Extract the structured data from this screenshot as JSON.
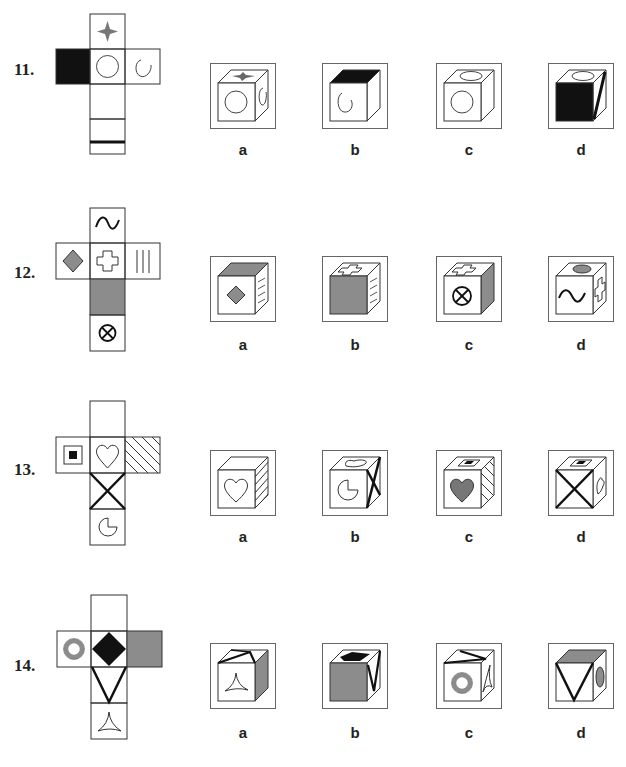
{
  "colors": {
    "gray": "#8c8c8c",
    "black": "#111111",
    "line": "#333333"
  },
  "questions": [
    {
      "number": "11.",
      "net": {
        "top": "four-point-star",
        "left": "solid-black",
        "center": "circle",
        "right": "spiral",
        "below1": "blank",
        "below2": "thick-horizontal-line"
      },
      "options": [
        {
          "label": "a",
          "top": "four-point-star",
          "front": "circle",
          "side": "spiral"
        },
        {
          "label": "b",
          "top": "solid-black",
          "front": "spiral",
          "side": "blank"
        },
        {
          "label": "c",
          "top": "ellipse",
          "front": "circle",
          "side": "blank"
        },
        {
          "label": "d",
          "top": "ellipse",
          "front": "solid-black",
          "side": "thick-diagonal-line"
        }
      ]
    },
    {
      "number": "12.",
      "net": {
        "top": "wave",
        "left": "gray-diamond",
        "center": "cross-outline",
        "right": "vertical-lines",
        "below1": "solid-gray",
        "below2": "circled-x"
      },
      "options": [
        {
          "label": "a",
          "top": "solid-gray",
          "front": "gray-diamond",
          "side": "lines"
        },
        {
          "label": "b",
          "top": "cross-outline",
          "front": "solid-gray",
          "side": "lines"
        },
        {
          "label": "c",
          "top": "cross-outline",
          "front": "circled-x",
          "side": "solid-gray"
        },
        {
          "label": "d",
          "top": "gray-ellipse",
          "front": "wave",
          "side": "cross-outline"
        }
      ]
    },
    {
      "number": "13.",
      "net": {
        "top": "blank",
        "left": "square-in-square",
        "center": "heart-outline",
        "right": "diagonal-hatch",
        "below1": "thick-x",
        "below2": "pac-shape"
      },
      "options": [
        {
          "label": "a",
          "top": "blank",
          "front": "heart-outline",
          "side": "diagonal-hatch"
        },
        {
          "label": "b",
          "top": "heart-outline",
          "front": "pac-shape",
          "side": "thick-x"
        },
        {
          "label": "c",
          "top": "square-in-square",
          "front": "gray-heart",
          "side": "diagonal-hatch"
        },
        {
          "label": "d",
          "top": "square-in-square",
          "front": "thick-x",
          "side": "heart-outline"
        }
      ]
    },
    {
      "number": "14.",
      "net": {
        "top": "blank",
        "left": "gray-ring",
        "center": "black-diamond",
        "right": "solid-gray",
        "below1": "thick-v",
        "below2": "three-point-star"
      },
      "options": [
        {
          "label": "a",
          "top": "thick-v",
          "front": "three-point-star",
          "side": "solid-gray"
        },
        {
          "label": "b",
          "top": "black-diamond",
          "front": "solid-gray",
          "side": "thick-v"
        },
        {
          "label": "c",
          "top": "thick-v",
          "front": "gray-ring",
          "side": "three-point-star"
        },
        {
          "label": "d",
          "top": "solid-gray",
          "front": "thick-v",
          "side": "gray-ellipse"
        }
      ]
    }
  ]
}
